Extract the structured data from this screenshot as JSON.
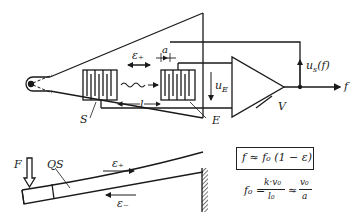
{
  "diagram": {
    "type": "schematic",
    "labels": {
      "transmitter": "S",
      "receiver": "E",
      "amplifier": "V",
      "strain_plus_top": "ε₊",
      "finger_spacing": "a",
      "distance": "l",
      "receiver_voltage": "u",
      "receiver_voltage_sub": "E",
      "output_voltage": "u",
      "output_voltage_sub": "s",
      "output_voltage_arg": "(f)",
      "output_frequency": "f",
      "force": "F",
      "cross_section": "QS",
      "beam_strain_plus": "ε₊",
      "beam_strain_minus": "ε₋"
    },
    "formulas": {
      "boxed": "f ≈ f₀ (1 − ε)",
      "f0_lhs": "f₀ =",
      "f0_frac1_num": "k·v₀",
      "f0_frac1_den": "l₀",
      "approx": "≈",
      "f0_frac2_num": "v₀",
      "f0_frac2_den": "a"
    },
    "colors": {
      "ink": "#1a1a1a",
      "background": "#ffffff"
    }
  }
}
